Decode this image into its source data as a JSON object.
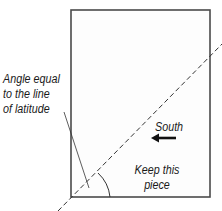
{
  "diagram": {
    "labels": {
      "angle_line1": "Angle equal",
      "angle_line2": "to the line",
      "angle_line3": "of latitude",
      "south": "South",
      "keep_line1": "Keep this",
      "keep_line2": "piece"
    },
    "colors": {
      "line": "#444444",
      "text": "#1a1a1a",
      "background": "#ffffff"
    }
  }
}
